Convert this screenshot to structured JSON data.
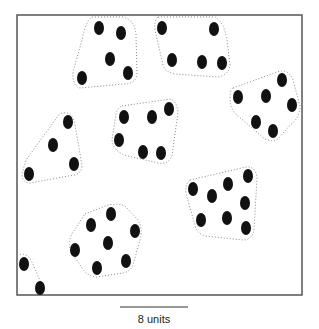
{
  "diagram": {
    "frame": {
      "x": 17,
      "y": 15,
      "width": 285,
      "height": 280,
      "stroke": "#555555"
    },
    "dot": {
      "rx": 5,
      "ry": 7,
      "fill": "#111111"
    },
    "hull_stroke": "#888888",
    "clusters": [
      {
        "id": "cluster-1",
        "dots": [
          [
            99,
            28
          ],
          [
            121,
            33
          ],
          [
            110,
            59
          ],
          [
            128,
            73
          ],
          [
            82,
            78
          ]
        ],
        "hull": "M92,17 L123,17 Q135,20 136,35 L137,75 Q135,84 124,84 L80,88 Q72,86 73,72 L82,40 Q86,20 92,17 Z"
      },
      {
        "id": "cluster-2",
        "dots": [
          [
            162,
            28
          ],
          [
            214,
            29
          ],
          [
            172,
            60
          ],
          [
            202,
            62
          ],
          [
            222,
            63
          ]
        ],
        "hull": "M158,17 L215,17 Q224,22 227,40 L230,65 Q229,75 218,77 L175,74 Q165,72 163,65 L155,30 Q154,20 158,17 Z"
      },
      {
        "id": "cluster-3",
        "dots": [
          [
            124,
            117
          ],
          [
            152,
            117
          ],
          [
            169,
            109
          ],
          [
            119,
            140
          ],
          [
            143,
            152
          ],
          [
            161,
            153
          ]
        ],
        "hull": "M122,106 L170,99 Q177,101 178,112 L172,156 Q168,165 158,163 L124,155 Q113,150 112,140 L116,114 Q117,108 122,106 Z"
      },
      {
        "id": "cluster-4",
        "dots": [
          [
            68,
            122
          ],
          [
            53,
            145
          ],
          [
            74,
            164
          ],
          [
            29,
            174
          ]
        ],
        "hull": "M64,113 Q73,112 75,125 L82,165 Q82,174 74,175 L30,183 Q22,183 22,174 L26,160 L58,116 Q60,113 64,113 Z"
      },
      {
        "id": "cluster-5",
        "dots": [
          [
            282,
            80
          ],
          [
            238,
            97
          ],
          [
            266,
            96
          ],
          [
            292,
            105
          ],
          [
            256,
            122
          ],
          [
            273,
            131
          ]
        ],
        "hull": "M233,88 L280,71 Q289,70 293,80 L300,106 Q300,118 290,125 L278,139 Q272,142 265,139 L238,116 Q230,110 230,98 Q230,90 233,88 Z"
      },
      {
        "id": "cluster-6",
        "dots": [
          [
            193,
            189
          ],
          [
            212,
            196
          ],
          [
            228,
            184
          ],
          [
            248,
            176
          ],
          [
            245,
            203
          ],
          [
            201,
            220
          ],
          [
            227,
            218
          ],
          [
            246,
            228
          ]
        ],
        "hull": "M190,180 L246,167 Q256,166 257,178 L254,230 Q252,240 243,240 L205,236 Q196,233 195,225 L186,194 Q185,183 190,180 Z"
      },
      {
        "id": "cluster-7",
        "dots": [
          [
            111,
            214
          ],
          [
            91,
            225
          ],
          [
            135,
            231
          ],
          [
            108,
            243
          ],
          [
            75,
            250
          ],
          [
            126,
            261
          ],
          [
            97,
            268
          ]
        ],
        "hull": "M85,214 L108,205 Q118,203 125,206 L138,220 Q143,228 140,240 L133,265 Q130,272 123,273 L97,277 Q88,277 82,268 L70,250 Q68,240 73,232 L85,214 Z"
      },
      {
        "id": "cluster-8",
        "dots": [
          [
            24,
            264
          ],
          [
            40,
            288
          ]
        ],
        "hull": "M17,255 Q26,252 31,260 L45,292"
      }
    ],
    "scale_bar": {
      "x1": 120,
      "x2": 188,
      "y": 307,
      "label": "8 units"
    }
  }
}
